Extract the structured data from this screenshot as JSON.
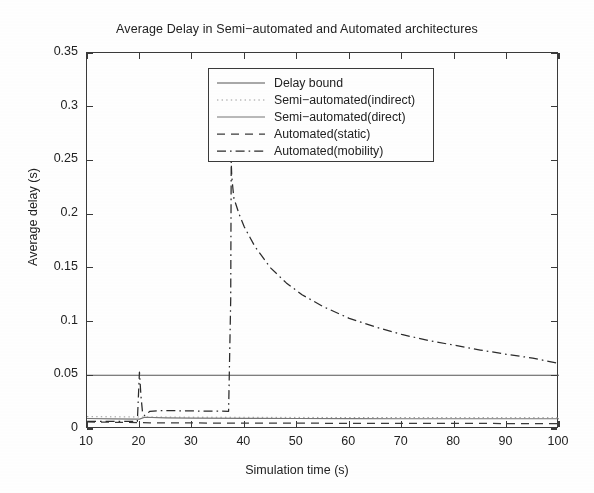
{
  "chart_data": {
    "type": "line",
    "title": "Average Delay in Semi−automated and Automated architectures",
    "xlabel": "Simulation time (s)",
    "ylabel": "Average delay (s)",
    "xlim": [
      10,
      100
    ],
    "ylim": [
      0,
      0.35
    ],
    "xticks": [
      10,
      20,
      30,
      40,
      50,
      60,
      70,
      80,
      90,
      100
    ],
    "yticks": [
      0,
      0.05,
      0.1,
      0.15,
      0.2,
      0.25,
      0.3,
      0.35
    ],
    "xtick_labels": [
      "10",
      "20",
      "30",
      "40",
      "50",
      "60",
      "70",
      "80",
      "90",
      "100"
    ],
    "ytick_labels": [
      "0",
      "0.05",
      "0.1",
      "0.15",
      "0.2",
      "0.25",
      "0.3",
      "0.35"
    ],
    "grid": false,
    "legend_position": "upper-center",
    "series": [
      {
        "name": "Delay bound",
        "style": "solid",
        "color": "#555555",
        "x": [
          10,
          100
        ],
        "y": [
          0.05,
          0.05
        ]
      },
      {
        "name": "Semi-automated(indirect)",
        "style": "dotted",
        "color": "#9a9a9a",
        "x": [
          10,
          20,
          30,
          40,
          50,
          60,
          70,
          80,
          90,
          100
        ],
        "y": [
          0.0115,
          0.0112,
          0.011,
          0.0109,
          0.0108,
          0.0107,
          0.0107,
          0.0106,
          0.0106,
          0.0105
        ]
      },
      {
        "name": "Semi-automated(direct)",
        "style": "solid",
        "color": "#777777",
        "x": [
          10,
          15,
          20,
          21,
          25,
          30,
          40,
          50,
          60,
          70,
          80,
          90,
          100
        ],
        "y": [
          0.0098,
          0.0094,
          0.0092,
          0.011,
          0.0104,
          0.0101,
          0.0099,
          0.0098,
          0.0097,
          0.0096,
          0.0096,
          0.0095,
          0.0095
        ]
      },
      {
        "name": "Automated(static)",
        "style": "dashed",
        "color": "#3a3a3a",
        "x": [
          10,
          14,
          18,
          20,
          22,
          26,
          30,
          40,
          50,
          60,
          70,
          80,
          90,
          100
        ],
        "y": [
          0.0066,
          0.0063,
          0.0061,
          0.006,
          0.0058,
          0.0057,
          0.0056,
          0.0055,
          0.0054,
          0.0053,
          0.0052,
          0.0052,
          0.0051,
          0.0051
        ]
      },
      {
        "name": "Automated(mobility)",
        "style": "dashdot",
        "color": "#2b2b2b",
        "x": [
          10,
          19.6,
          20.0,
          20.3,
          20.6,
          21.0,
          22,
          24,
          27,
          30,
          34,
          37.0,
          37.4,
          37.5,
          37.6,
          38,
          39,
          40,
          42,
          45,
          48,
          51,
          55,
          60,
          65,
          70,
          75,
          80,
          85,
          90,
          95,
          100
        ],
        "y": [
          0.007,
          0.007,
          0.053,
          0.03,
          0.015,
          0.0125,
          0.0165,
          0.0172,
          0.017,
          0.0168,
          0.0166,
          0.0165,
          0.12,
          0.249,
          0.235,
          0.215,
          0.2,
          0.188,
          0.17,
          0.15,
          0.136,
          0.125,
          0.114,
          0.103,
          0.095,
          0.088,
          0.0825,
          0.078,
          0.0735,
          0.0695,
          0.066,
          0.061
        ]
      }
    ],
    "legend_entries": [
      {
        "label": "Delay bound",
        "style": "solid",
        "color": "#555555"
      },
      {
        "label": "Semi−automated(indirect)",
        "style": "dotted",
        "color": "#9a9a9a"
      },
      {
        "label": "Semi−automated(direct)",
        "style": "solid",
        "color": "#777777"
      },
      {
        "label": "Automated(static)",
        "style": "dashed",
        "color": "#3a3a3a"
      },
      {
        "label": "Automated(mobility)",
        "style": "dashdot",
        "color": "#2b2b2b"
      }
    ]
  }
}
